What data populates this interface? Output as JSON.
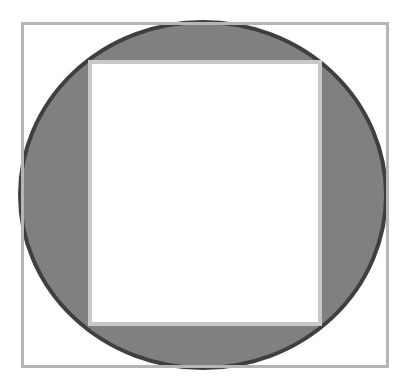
{
  "figure": {
    "canvas": {
      "width": 412,
      "height": 384,
      "background_color": "#ffffff"
    },
    "shapes": {
      "outer_square": {
        "name": "outer-square",
        "label": "Outer square outline",
        "x": 21,
        "y": 22,
        "width": 368,
        "height": 346,
        "fill": "none",
        "stroke_color": "#b5b5b5",
        "stroke_width": 3
      },
      "circle": {
        "name": "circle",
        "label": "Gray filled circle",
        "center_x": 203,
        "center_y": 195,
        "radius_x": 185,
        "radius_y": 175,
        "fill_color": "#808080",
        "stroke_color": "#3f3f3f",
        "stroke_width": 4
      },
      "inner_square": {
        "name": "inner-square",
        "label": "Inner white square",
        "x": 88,
        "y": 60,
        "width": 234,
        "height": 266,
        "fill_color": "#ffffff",
        "stroke_color": "#c9c9c9",
        "stroke_width": 4
      }
    }
  }
}
